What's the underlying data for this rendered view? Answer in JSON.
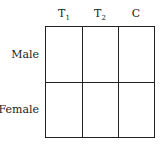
{
  "table": {
    "columns": [
      {
        "label": "T",
        "sub": "1"
      },
      {
        "label": "T",
        "sub": "2"
      },
      {
        "label": "C",
        "sub": ""
      }
    ],
    "rows": [
      {
        "label": "Male"
      },
      {
        "label": "Female"
      }
    ],
    "cells": [
      [
        "",
        "",
        ""
      ],
      [
        "",
        "",
        ""
      ]
    ]
  }
}
